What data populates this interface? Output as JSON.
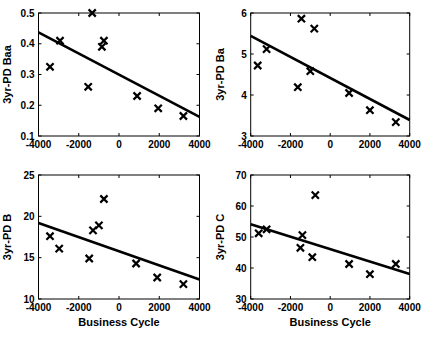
{
  "figure": {
    "background_color": "#ffffff",
    "ink_color": "#000000",
    "marker_glyph": "x"
  },
  "chart_data": [
    {
      "id": "pd-baa",
      "type": "scatter",
      "title": "",
      "xlabel": "",
      "ylabel": "3yr-PD Baa",
      "xlim": [
        -4000,
        4000
      ],
      "ylim": [
        0.1,
        0.5
      ],
      "xticks": [
        -4000,
        -2000,
        0,
        2000,
        4000
      ],
      "xtick_labels": [
        "-4000",
        "-2000",
        "0",
        "2000",
        "4000"
      ],
      "yticks": [
        0.1,
        0.2,
        0.3,
        0.4,
        0.5
      ],
      "ytick_labels": [
        "0.1",
        "0.2",
        "0.3",
        "0.4",
        "0.5"
      ],
      "grid": false,
      "legend": false,
      "marker": "x",
      "points": [
        [
          -3430,
          0.325
        ],
        [
          -2930,
          0.41
        ],
        [
          -1530,
          0.26
        ],
        [
          -1330,
          0.5
        ],
        [
          -850,
          0.39
        ],
        [
          -750,
          0.41
        ],
        [
          900,
          0.23
        ],
        [
          1950,
          0.19
        ],
        [
          3200,
          0.165
        ]
      ],
      "trendline": {
        "x1": -4000,
        "y1": 0.437,
        "x2": 4000,
        "y2": 0.162
      }
    },
    {
      "id": "pd-ba",
      "type": "scatter",
      "title": "",
      "xlabel": "",
      "ylabel": "3yr-PD Ba",
      "xlim": [
        -4000,
        4000
      ],
      "ylim": [
        3,
        6
      ],
      "xticks": [
        -4000,
        -2000,
        0,
        2000,
        4000
      ],
      "xtick_labels": [
        "-4000",
        "-2000",
        "0",
        "2000",
        "4000"
      ],
      "yticks": [
        3,
        4,
        5,
        6
      ],
      "ytick_labels": [
        "3",
        "4",
        "5",
        "6"
      ],
      "grid": false,
      "legend": false,
      "marker": "x",
      "points": [
        [
          -3650,
          4.72
        ],
        [
          -3200,
          5.12
        ],
        [
          -1630,
          4.19
        ],
        [
          -1450,
          5.86
        ],
        [
          -1000,
          4.58
        ],
        [
          -800,
          5.62
        ],
        [
          950,
          4.05
        ],
        [
          2000,
          3.63
        ],
        [
          3300,
          3.34
        ]
      ],
      "trendline": {
        "x1": -4000,
        "y1": 5.44,
        "x2": 4000,
        "y2": 3.39
      }
    },
    {
      "id": "pd-b",
      "type": "scatter",
      "title": "",
      "xlabel": "Business Cycle",
      "ylabel": "3yr-PD B",
      "xlim": [
        -4000,
        4000
      ],
      "ylim": [
        10,
        25
      ],
      "xticks": [
        -4000,
        -2000,
        0,
        2000,
        4000
      ],
      "xtick_labels": [
        "-4000",
        "-2000",
        "0",
        "2000",
        "4000"
      ],
      "yticks": [
        10,
        15,
        20,
        25
      ],
      "ytick_labels": [
        "10",
        "15",
        "20",
        "25"
      ],
      "grid": false,
      "legend": false,
      "marker": "x",
      "points": [
        [
          -3430,
          17.6
        ],
        [
          -2970,
          16.1
        ],
        [
          -1480,
          14.9
        ],
        [
          -1290,
          18.3
        ],
        [
          -1000,
          18.9
        ],
        [
          -750,
          22.1
        ],
        [
          850,
          14.3
        ],
        [
          1900,
          12.6
        ],
        [
          3200,
          11.8
        ]
      ],
      "trendline": {
        "x1": -4000,
        "y1": 19.2,
        "x2": 4000,
        "y2": 12.35
      }
    },
    {
      "id": "pd-c",
      "type": "scatter",
      "title": "",
      "xlabel": "Business Cycle",
      "ylabel": "3yr-PD C",
      "xlim": [
        -4000,
        4000
      ],
      "ylim": [
        30,
        70
      ],
      "xticks": [
        -4000,
        -2000,
        0,
        2000,
        4000
      ],
      "xtick_labels": [
        "-4000",
        "-2000",
        "0",
        "2000",
        "4000"
      ],
      "yticks": [
        30,
        40,
        50,
        60,
        70
      ],
      "ytick_labels": [
        "30",
        "40",
        "50",
        "60",
        "70"
      ],
      "grid": false,
      "legend": false,
      "marker": "x",
      "points": [
        [
          -3600,
          51.2
        ],
        [
          -3200,
          52.5
        ],
        [
          -1500,
          46.5
        ],
        [
          -1400,
          50.6
        ],
        [
          -900,
          43.5
        ],
        [
          -750,
          63.5
        ],
        [
          950,
          41.3
        ],
        [
          2000,
          38.0
        ],
        [
          3300,
          41.3
        ]
      ],
      "trendline": {
        "x1": -4000,
        "y1": 54.1,
        "x2": 4000,
        "y2": 38.1
      }
    }
  ]
}
